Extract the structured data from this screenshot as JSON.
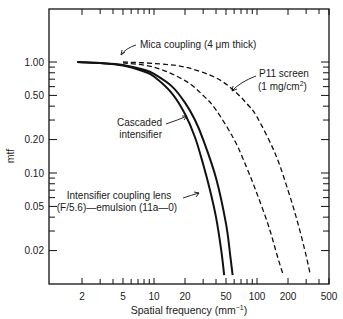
{
  "chart_data": {
    "type": "line",
    "title": "",
    "xlabel": "Spatial frequency (mm⁻¹)",
    "ylabel": "mtf",
    "xscale": "log",
    "yscale": "log",
    "xlim": [
      1,
      500
    ],
    "ylim": [
      0.012,
      3.0
    ],
    "grid": false,
    "x_ticks": [
      2,
      5,
      10,
      20,
      50,
      100,
      200,
      500
    ],
    "x_tick_labels": [
      "2",
      "5",
      "10",
      "20",
      "50",
      "100",
      "200",
      "500"
    ],
    "y_ticks": [
      1.0,
      0.5,
      0.2,
      0.1,
      0.05,
      0.02
    ],
    "y_tick_labels": [
      "1.00",
      "0.50",
      "0.20",
      "0.10",
      "0.05",
      "0.02"
    ],
    "series": [
      {
        "name": "Intensifier coupling lens (F/5.6)—emulsion (11a–0)",
        "style": "solid",
        "x": [
          1.8,
          3,
          5,
          8,
          10,
          15,
          20,
          25,
          30,
          35,
          40,
          45,
          48
        ],
        "y": [
          1.0,
          0.98,
          0.93,
          0.82,
          0.74,
          0.52,
          0.34,
          0.21,
          0.12,
          0.07,
          0.04,
          0.02,
          0.012
        ]
      },
      {
        "name": "Cascaded intensifier",
        "style": "solid",
        "x": [
          1.8,
          3,
          5,
          8,
          10,
          15,
          20,
          25,
          30,
          40,
          50,
          55,
          58
        ],
        "y": [
          1.0,
          0.98,
          0.94,
          0.85,
          0.78,
          0.6,
          0.43,
          0.3,
          0.2,
          0.09,
          0.035,
          0.018,
          0.012
        ]
      },
      {
        "name": "P11 screen (1 mg/cm²)",
        "style": "dashed",
        "x": [
          5,
          10,
          20,
          30,
          40,
          60,
          80,
          100,
          130,
          160,
          180
        ],
        "y": [
          0.98,
          0.9,
          0.68,
          0.5,
          0.37,
          0.2,
          0.11,
          0.065,
          0.033,
          0.017,
          0.012
        ]
      },
      {
        "name": "Mica coupling (4 µm thick)",
        "style": "dashed",
        "x": [
          5,
          10,
          20,
          40,
          60,
          80,
          100,
          150,
          200,
          250,
          300,
          330
        ],
        "y": [
          1.0,
          0.97,
          0.9,
          0.72,
          0.55,
          0.42,
          0.32,
          0.15,
          0.07,
          0.035,
          0.018,
          0.012
        ]
      }
    ],
    "annotations": [
      {
        "text": "Mica coupling (4 μm thick)",
        "target": "Mica coupling (4 µm thick)"
      },
      {
        "text": "P11 screen",
        "text2": "(1 mg/cm²)",
        "target": "P11 screen (1 mg/cm²)"
      },
      {
        "text": "Cascaded",
        "text2": "intensifier",
        "target": "Cascaded intensifier"
      },
      {
        "text": "Intensifier coupling lens",
        "text2": "(F/5.6)—emulsion (11a–0)",
        "target": "Intensifier coupling lens (F/5.6)—emulsion (11a–0)"
      }
    ],
    "legend": "none (inline annotations with arrows)"
  }
}
